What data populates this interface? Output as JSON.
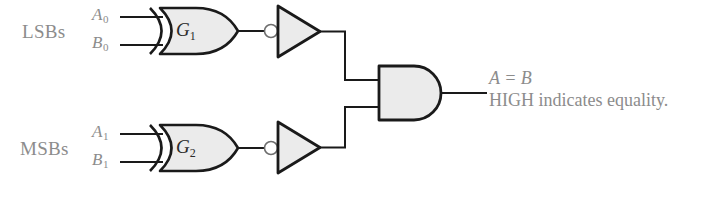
{
  "diagram": {
    "background_color": "#ffffff",
    "line_color": "#1a1a1a",
    "gate_fill_color": "#ebebeb",
    "text_color": "#8c8c8c",
    "gate_label_color": "#2a2a2a"
  },
  "groups": [
    {
      "label": "LSBs"
    },
    {
      "label": "MSBs"
    }
  ],
  "inputs": [
    {
      "name": "A",
      "index": "0",
      "icon": "input-wire"
    },
    {
      "name": "B",
      "index": "0",
      "icon": "input-wire"
    },
    {
      "name": "A",
      "index": "1",
      "icon": "input-wire"
    },
    {
      "name": "B",
      "index": "1",
      "icon": "input-wire"
    }
  ],
  "gates": [
    {
      "id": "G1",
      "name": "G",
      "index": "1",
      "type": "xor-gate"
    },
    {
      "id": "G2",
      "name": "G",
      "index": "2",
      "type": "xor-gate"
    },
    {
      "id": "INV1",
      "type": "inverter-gate"
    },
    {
      "id": "INV2",
      "type": "inverter-gate"
    },
    {
      "id": "AND1",
      "type": "and-gate"
    }
  ],
  "output": {
    "equation": "A = B",
    "note": "HIGH indicates equality."
  }
}
